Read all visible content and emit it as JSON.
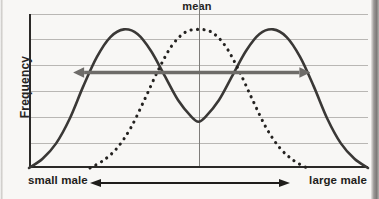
{
  "chart_data": {
    "type": "line",
    "title": "mean",
    "xlabel": "",
    "ylabel": "Frequency",
    "xlim": [
      0,
      100
    ],
    "ylim": [
      0,
      100
    ],
    "grid": true,
    "gridlines_horizontal": 6,
    "legend": "none",
    "x_axis_low_label": "small male",
    "x_axis_high_label": "large male",
    "mean_marker_x": 50,
    "series": [
      {
        "name": "disruptive (bimodal) distribution",
        "style": "solid",
        "color": "#3a3836",
        "x": [
          0,
          4,
          8,
          12,
          16,
          20,
          24,
          28,
          32,
          36,
          40,
          44,
          48,
          50,
          52,
          56,
          60,
          64,
          68,
          72,
          76,
          80,
          84,
          88,
          92,
          96,
          100
        ],
        "values": [
          0,
          6,
          16,
          32,
          53,
          72,
          85,
          90,
          87,
          76,
          60,
          44,
          33,
          30,
          33,
          44,
          60,
          76,
          87,
          90,
          85,
          72,
          53,
          32,
          16,
          6,
          0
        ]
      },
      {
        "name": "original (normal) distribution",
        "style": "dotted",
        "color": "#242220",
        "x": [
          18,
          22,
          26,
          30,
          34,
          38,
          42,
          46,
          50,
          54,
          58,
          62,
          66,
          70,
          74,
          78,
          82
        ],
        "values": [
          0,
          5,
          13,
          26,
          44,
          63,
          79,
          88,
          90,
          88,
          79,
          63,
          44,
          26,
          13,
          5,
          0
        ]
      }
    ],
    "annotations": [
      {
        "name": "variation-range-arrow",
        "type": "double-headed-arrow",
        "color": "#6e6c69",
        "x_start": 13,
        "x_end": 83,
        "y": 62
      },
      {
        "name": "x-axis-direction-arrow",
        "type": "double-headed-arrow",
        "color": "#1f1d1b"
      }
    ]
  },
  "figure": {
    "title": "mean",
    "y_axis_label": "Frequency",
    "x_low_label": "small male",
    "x_high_label": "large male"
  }
}
